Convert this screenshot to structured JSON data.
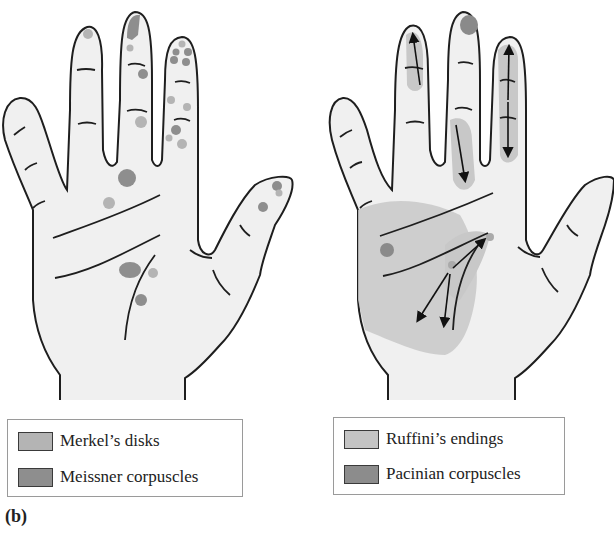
{
  "figure": {
    "panel_label": "(b)",
    "colors": {
      "skin": "#f0f0f0",
      "outline": "#1e1e1e",
      "merkel": "#b4b4b4",
      "meissner": "#8e8e8e",
      "ruffini": "#c8c8c8",
      "pacinian": "#8a8a8a",
      "arrow": "#111111"
    },
    "left_hand": {
      "legend": [
        {
          "label": "Merkel’s disks",
          "swatch": "#b4b4b4"
        },
        {
          "label": "Meissner corpuscles",
          "swatch": "#8e8e8e"
        }
      ]
    },
    "right_hand": {
      "legend": [
        {
          "label": "Ruffini’s endings",
          "swatch": "#c4c4c4"
        },
        {
          "label": "Pacinian corpuscles",
          "swatch": "#8c8c8c"
        }
      ]
    }
  }
}
